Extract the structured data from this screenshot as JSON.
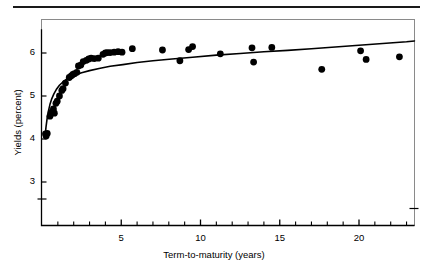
{
  "figure": {
    "top_rule": true,
    "frame": {
      "x": 41,
      "y": 19,
      "width": 373,
      "height": 206,
      "color": "#8a8a8a"
    }
  },
  "chart_data": {
    "type": "scatter",
    "title": "",
    "xlabel": "Term-to-maturity (years)",
    "ylabel": "Yields (percent)",
    "xlim": [
      0,
      23.5
    ],
    "ylim": [
      2.55,
      6.65
    ],
    "grid": false,
    "legend": null,
    "axis_break": {
      "axis": "y",
      "between": [
        3,
        4
      ],
      "note": "broken-axis mark below 3"
    },
    "yticks": [
      3,
      4,
      5,
      6
    ],
    "ytick_labels": [
      "3",
      "4",
      "5",
      "6"
    ],
    "xticks": [
      5,
      10,
      15,
      20
    ],
    "xtick_labels": [
      "5",
      "10",
      "15",
      "20"
    ],
    "x_minor_ticks": [
      1,
      2,
      3,
      4,
      6,
      7,
      8,
      9,
      11,
      12,
      13,
      14,
      16,
      17,
      18,
      19,
      21,
      22,
      23
    ],
    "marker": {
      "shape": "circle",
      "color": "#000000",
      "size": 3.4
    },
    "points": [
      {
        "x": 0.22,
        "y": 4.12
      },
      {
        "x": 0.26,
        "y": 4.07
      },
      {
        "x": 0.33,
        "y": 4.13
      },
      {
        "x": 0.5,
        "y": 4.53
      },
      {
        "x": 0.58,
        "y": 4.62
      },
      {
        "x": 0.72,
        "y": 4.7
      },
      {
        "x": 0.78,
        "y": 4.6
      },
      {
        "x": 0.88,
        "y": 4.83
      },
      {
        "x": 0.96,
        "y": 4.88
      },
      {
        "x": 1.1,
        "y": 5.0
      },
      {
        "x": 1.25,
        "y": 5.13
      },
      {
        "x": 1.33,
        "y": 5.17
      },
      {
        "x": 1.48,
        "y": 5.3
      },
      {
        "x": 1.72,
        "y": 5.43
      },
      {
        "x": 1.85,
        "y": 5.47
      },
      {
        "x": 1.95,
        "y": 5.5
      },
      {
        "x": 2.05,
        "y": 5.52
      },
      {
        "x": 2.2,
        "y": 5.55
      },
      {
        "x": 2.3,
        "y": 5.7
      },
      {
        "x": 2.45,
        "y": 5.72
      },
      {
        "x": 2.6,
        "y": 5.8
      },
      {
        "x": 2.8,
        "y": 5.83
      },
      {
        "x": 2.95,
        "y": 5.86
      },
      {
        "x": 3.1,
        "y": 5.88
      },
      {
        "x": 3.3,
        "y": 5.87
      },
      {
        "x": 3.55,
        "y": 5.88
      },
      {
        "x": 3.85,
        "y": 5.97
      },
      {
        "x": 4.0,
        "y": 6.0
      },
      {
        "x": 4.12,
        "y": 6.01
      },
      {
        "x": 4.3,
        "y": 6.01
      },
      {
        "x": 4.55,
        "y": 6.02
      },
      {
        "x": 4.8,
        "y": 6.03
      },
      {
        "x": 5.05,
        "y": 6.02
      },
      {
        "x": 5.7,
        "y": 6.1
      },
      {
        "x": 7.6,
        "y": 6.07
      },
      {
        "x": 8.7,
        "y": 5.82
      },
      {
        "x": 9.25,
        "y": 6.08
      },
      {
        "x": 9.5,
        "y": 6.15
      },
      {
        "x": 11.25,
        "y": 5.98
      },
      {
        "x": 13.25,
        "y": 6.12
      },
      {
        "x": 13.35,
        "y": 5.79
      },
      {
        "x": 14.5,
        "y": 6.13
      },
      {
        "x": 17.65,
        "y": 5.62
      },
      {
        "x": 20.1,
        "y": 6.05
      },
      {
        "x": 20.45,
        "y": 5.85
      },
      {
        "x": 22.55,
        "y": 5.91
      }
    ],
    "fit_curve": {
      "label": "fitted yield curve",
      "color": "#000000",
      "width": 1.6,
      "points": [
        {
          "x": 0.2,
          "y": 4.08
        },
        {
          "x": 0.25,
          "y": 4.27
        },
        {
          "x": 0.32,
          "y": 4.47
        },
        {
          "x": 0.4,
          "y": 4.64
        },
        {
          "x": 0.5,
          "y": 4.8
        },
        {
          "x": 0.62,
          "y": 4.94
        },
        {
          "x": 0.75,
          "y": 5.05
        },
        {
          "x": 0.9,
          "y": 5.15
        },
        {
          "x": 1.1,
          "y": 5.25
        },
        {
          "x": 1.3,
          "y": 5.32
        },
        {
          "x": 1.55,
          "y": 5.39
        },
        {
          "x": 1.8,
          "y": 5.44
        },
        {
          "x": 2.1,
          "y": 5.49
        },
        {
          "x": 2.5,
          "y": 5.54
        },
        {
          "x": 3.0,
          "y": 5.59
        },
        {
          "x": 3.6,
          "y": 5.64
        },
        {
          "x": 4.3,
          "y": 5.69
        },
        {
          "x": 5.1,
          "y": 5.73
        },
        {
          "x": 6.0,
          "y": 5.78
        },
        {
          "x": 7.0,
          "y": 5.82
        },
        {
          "x": 8.2,
          "y": 5.86
        },
        {
          "x": 9.5,
          "y": 5.9
        },
        {
          "x": 11.0,
          "y": 5.95
        },
        {
          "x": 12.5,
          "y": 5.99
        },
        {
          "x": 14.0,
          "y": 6.03
        },
        {
          "x": 15.5,
          "y": 6.06
        },
        {
          "x": 17.0,
          "y": 6.1
        },
        {
          "x": 18.5,
          "y": 6.14
        },
        {
          "x": 20.0,
          "y": 6.18
        },
        {
          "x": 21.5,
          "y": 6.22
        },
        {
          "x": 23.0,
          "y": 6.26
        },
        {
          "x": 23.5,
          "y": 6.28
        }
      ]
    }
  }
}
